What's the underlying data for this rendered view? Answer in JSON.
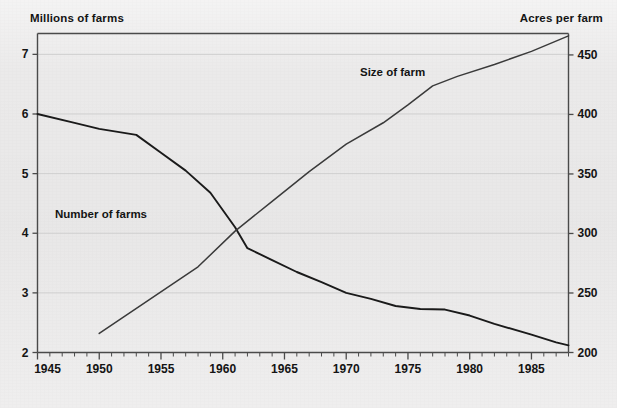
{
  "chart_data": {
    "type": "line",
    "title": "",
    "xlabel": "",
    "ylabel": "Millions of farms",
    "y2label": "Acres per farm",
    "grid": true,
    "legend_position": "inline-annotations",
    "xlim": [
      1945,
      1988
    ],
    "ylim": [
      2,
      7.35
    ],
    "y2lim": [
      200,
      468
    ],
    "x_ticks": [
      1945,
      1950,
      1955,
      1960,
      1965,
      1970,
      1975,
      1980,
      1985
    ],
    "x_tick_labels": [
      "1945",
      "1950",
      "1955",
      "1960",
      "1965",
      "1970",
      "1975",
      "1980",
      "1985"
    ],
    "x_minor_tick_interval": 1,
    "y_ticks": [
      2,
      3,
      4,
      5,
      6,
      7
    ],
    "y_tick_labels": [
      "2",
      "3",
      "4",
      "5",
      "6",
      "7"
    ],
    "y2_ticks": [
      200,
      250,
      300,
      350,
      400,
      450
    ],
    "y2_tick_labels": [
      "200",
      "250",
      "300",
      "350",
      "400",
      "450"
    ],
    "annotations": [
      {
        "text": "Size of farm",
        "x": 1973,
        "y2": 428
      },
      {
        "text": "Number of farms",
        "x": 1953,
        "y": 4.45
      }
    ],
    "series": [
      {
        "name": "Number of farms",
        "axis": "left",
        "units": "millions",
        "color": "#1a1a1a",
        "x": [
          1945,
          1948,
          1950,
          1953,
          1955,
          1957,
          1959,
          1961,
          1962,
          1964,
          1966,
          1968,
          1970,
          1972,
          1974,
          1976,
          1978,
          1980,
          1982,
          1985,
          1987,
          1988
        ],
        "y": [
          6.0,
          5.85,
          5.75,
          5.65,
          5.35,
          5.05,
          4.68,
          4.1,
          3.75,
          3.55,
          3.35,
          3.18,
          3.0,
          2.9,
          2.78,
          2.73,
          2.72,
          2.62,
          2.48,
          2.3,
          2.17,
          2.12
        ]
      },
      {
        "name": "Size of farm",
        "axis": "right",
        "units": "acres",
        "color": "#3a3a3a",
        "x": [
          1950,
          1954,
          1958,
          1961,
          1964,
          1967,
          1970,
          1973,
          1975,
          1977,
          1979,
          1982,
          1985,
          1988
        ],
        "y": [
          216,
          244,
          272,
          302,
          327,
          352,
          375,
          393,
          408,
          424,
          432,
          442,
          453,
          466
        ]
      }
    ]
  }
}
